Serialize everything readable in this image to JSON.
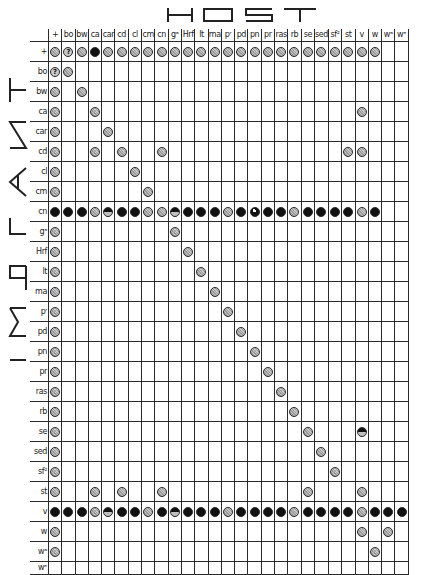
{
  "titles": {
    "host": "HOST",
    "implant": "IMPLANT"
  },
  "legend_codes": {
    "g": "grey hatched circle",
    "b": "solid black circle",
    "h": "half black circle (top black)",
    "n": "black circle with white notch",
    "q": "circle with question mark",
    "": "empty cell"
  },
  "columns": [
    "+",
    "bo",
    "bw",
    "ca",
    "car",
    "cd",
    "cl",
    "cm",
    "cn",
    "gᵃ",
    "Hrf",
    "lt",
    "ma",
    "pʳ",
    "pd",
    "pn",
    "pr",
    "ras",
    "rb",
    "se",
    "sed",
    "sf²",
    "st",
    "v",
    "w",
    "wᵃ",
    "wᵉ"
  ],
  "rows": [
    {
      "label": "+",
      "cells": [
        "g",
        "q",
        "g",
        "b",
        "g",
        "g",
        "g",
        "g",
        "g",
        "g",
        "g",
        "g",
        "g",
        "g",
        "g",
        "g",
        "g",
        "g",
        "g",
        "g",
        "g",
        "g",
        "g",
        "g",
        "g",
        "",
        ""
      ]
    },
    {
      "label": "bo",
      "cells": [
        "q",
        "g",
        "",
        "",
        "",
        "",
        "",
        "",
        "",
        "",
        "",
        "",
        "",
        "",
        "",
        "",
        "",
        "",
        "",
        "",
        "",
        "",
        "",
        "",
        "",
        "",
        ""
      ]
    },
    {
      "label": "bw",
      "cells": [
        "g",
        "",
        "g",
        "",
        "",
        "",
        "",
        "",
        "",
        "",
        "",
        "",
        "",
        "",
        "",
        "",
        "",
        "",
        "",
        "",
        "",
        "",
        "",
        "",
        "",
        "",
        ""
      ]
    },
    {
      "label": "ca",
      "cells": [
        "g",
        "",
        "",
        "g",
        "",
        "",
        "",
        "",
        "",
        "",
        "",
        "",
        "",
        "",
        "",
        "",
        "",
        "",
        "",
        "",
        "",
        "",
        "",
        "g",
        "",
        "",
        ""
      ]
    },
    {
      "label": "car",
      "cells": [
        "g",
        "",
        "",
        "",
        "g",
        "",
        "",
        "",
        "",
        "",
        "",
        "",
        "",
        "",
        "",
        "",
        "",
        "",
        "",
        "",
        "",
        "",
        "",
        "",
        "",
        "",
        ""
      ]
    },
    {
      "label": "cd",
      "cells": [
        "g",
        "",
        "",
        "g",
        "",
        "g",
        "",
        "",
        "g",
        "",
        "",
        "",
        "",
        "",
        "",
        "",
        "",
        "",
        "",
        "",
        "",
        "",
        "g",
        "g",
        "",
        "",
        ""
      ]
    },
    {
      "label": "cl",
      "cells": [
        "g",
        "",
        "",
        "",
        "",
        "",
        "g",
        "",
        "",
        "",
        "",
        "",
        "",
        "",
        "",
        "",
        "",
        "",
        "",
        "",
        "",
        "",
        "",
        "",
        "",
        "",
        ""
      ]
    },
    {
      "label": "cm",
      "cells": [
        "g",
        "",
        "",
        "",
        "",
        "",
        "",
        "g",
        "",
        "",
        "",
        "",
        "",
        "",
        "",
        "",
        "",
        "",
        "",
        "",
        "",
        "",
        "",
        "",
        "",
        "",
        ""
      ]
    },
    {
      "label": "cn",
      "cells": [
        "b",
        "b",
        "b",
        "g",
        "h",
        "b",
        "b",
        "g",
        "g",
        "h",
        "b",
        "b",
        "b",
        "g",
        "b",
        "n",
        "b",
        "b",
        "g",
        "b",
        "b",
        "b",
        "b",
        "g",
        "b",
        "",
        ""
      ]
    },
    {
      "label": "gᵃ",
      "cells": [
        "g",
        "",
        "",
        "",
        "",
        "",
        "",
        "",
        "",
        "g",
        "",
        "",
        "",
        "",
        "",
        "",
        "",
        "",
        "",
        "",
        "",
        "",
        "",
        "",
        "",
        "",
        ""
      ]
    },
    {
      "label": "Hrf",
      "cells": [
        "g",
        "",
        "",
        "",
        "",
        "",
        "",
        "",
        "",
        "",
        "g",
        "",
        "",
        "",
        "",
        "",
        "",
        "",
        "",
        "",
        "",
        "",
        "",
        "",
        "",
        "",
        ""
      ]
    },
    {
      "label": "lt",
      "cells": [
        "g",
        "",
        "",
        "",
        "",
        "",
        "",
        "",
        "",
        "",
        "",
        "g",
        "",
        "",
        "",
        "",
        "",
        "",
        "",
        "",
        "",
        "",
        "",
        "",
        "",
        "",
        ""
      ]
    },
    {
      "label": "ma",
      "cells": [
        "g",
        "",
        "",
        "",
        "",
        "",
        "",
        "",
        "",
        "",
        "",
        "",
        "g",
        "",
        "",
        "",
        "",
        "",
        "",
        "",
        "",
        "",
        "",
        "",
        "",
        "",
        ""
      ]
    },
    {
      "label": "pʳ",
      "cells": [
        "g",
        "",
        "",
        "",
        "",
        "",
        "",
        "",
        "",
        "",
        "",
        "",
        "",
        "g",
        "",
        "",
        "",
        "",
        "",
        "",
        "",
        "",
        "",
        "",
        "",
        "",
        ""
      ]
    },
    {
      "label": "pd",
      "cells": [
        "g",
        "",
        "",
        "",
        "",
        "",
        "",
        "",
        "",
        "",
        "",
        "",
        "",
        "",
        "g",
        "",
        "",
        "",
        "",
        "",
        "",
        "",
        "",
        "",
        "",
        "",
        ""
      ]
    },
    {
      "label": "pn",
      "cells": [
        "g",
        "",
        "",
        "",
        "",
        "",
        "",
        "",
        "",
        "",
        "",
        "",
        "",
        "",
        "",
        "g",
        "",
        "",
        "",
        "",
        "",
        "",
        "",
        "",
        "",
        "",
        ""
      ]
    },
    {
      "label": "pr",
      "cells": [
        "g",
        "",
        "",
        "",
        "",
        "",
        "",
        "",
        "",
        "",
        "",
        "",
        "",
        "",
        "",
        "",
        "g",
        "",
        "",
        "",
        "",
        "",
        "",
        "",
        "",
        "",
        ""
      ]
    },
    {
      "label": "ras",
      "cells": [
        "g",
        "",
        "",
        "",
        "",
        "",
        "",
        "",
        "",
        "",
        "",
        "",
        "",
        "",
        "",
        "",
        "",
        "g",
        "",
        "",
        "",
        "",
        "",
        "",
        "",
        "",
        ""
      ]
    },
    {
      "label": "rb",
      "cells": [
        "g",
        "",
        "",
        "",
        "",
        "",
        "",
        "",
        "",
        "",
        "",
        "",
        "",
        "",
        "",
        "",
        "",
        "",
        "g",
        "",
        "",
        "",
        "",
        "",
        "",
        "",
        ""
      ]
    },
    {
      "label": "se",
      "cells": [
        "g",
        "",
        "",
        "",
        "",
        "",
        "",
        "",
        "",
        "",
        "",
        "",
        "",
        "",
        "",
        "",
        "",
        "",
        "",
        "g",
        "",
        "",
        "",
        "h",
        "",
        "",
        ""
      ]
    },
    {
      "label": "sed",
      "cells": [
        "g",
        "",
        "",
        "",
        "",
        "",
        "",
        "",
        "",
        "",
        "",
        "",
        "",
        "",
        "",
        "",
        "",
        "",
        "",
        "",
        "g",
        "",
        "",
        "",
        "",
        "",
        ""
      ]
    },
    {
      "label": "sf²",
      "cells": [
        "g",
        "",
        "",
        "",
        "",
        "",
        "",
        "",
        "",
        "",
        "",
        "",
        "",
        "",
        "",
        "",
        "",
        "",
        "",
        "",
        "",
        "g",
        "",
        "",
        "",
        "",
        ""
      ]
    },
    {
      "label": "st",
      "cells": [
        "g",
        "",
        "",
        "g",
        "",
        "g",
        "",
        "",
        "g",
        "",
        "",
        "",
        "",
        "",
        "",
        "",
        "",
        "",
        "",
        "g",
        "",
        "",
        "",
        "g",
        "",
        "",
        ""
      ]
    },
    {
      "label": "v",
      "cells": [
        "b",
        "b",
        "b",
        "g",
        "h",
        "b",
        "b",
        "g",
        "b",
        "h",
        "b",
        "b",
        "b",
        "g",
        "b",
        "b",
        "b",
        "b",
        "g",
        "b",
        "b",
        "b",
        "b",
        "g",
        "b",
        "b",
        "b"
      ]
    },
    {
      "label": "w",
      "cells": [
        "g",
        "",
        "",
        "",
        "",
        "",
        "",
        "",
        "",
        "",
        "",
        "",
        "",
        "",
        "",
        "",
        "",
        "",
        "",
        "",
        "",
        "",
        "",
        "g",
        "",
        "g",
        ""
      ]
    },
    {
      "label": "wᵃ",
      "cells": [
        "g",
        "",
        "",
        "",
        "",
        "",
        "",
        "",
        "",
        "",
        "",
        "",
        "",
        "",
        "",
        "",
        "",
        "",
        "",
        "",
        "",
        "",
        "",
        "",
        "g",
        "",
        ""
      ]
    },
    {
      "label": "wᵉ",
      "cells": [
        "",
        "",
        "",
        "",
        "",
        "",
        "",
        "",
        "",
        "",
        "",
        "",
        "",
        "",
        "",
        "",
        "",
        "",
        "",
        "",
        "",
        "",
        "",
        "",
        "",
        "",
        ""
      ]
    }
  ]
}
